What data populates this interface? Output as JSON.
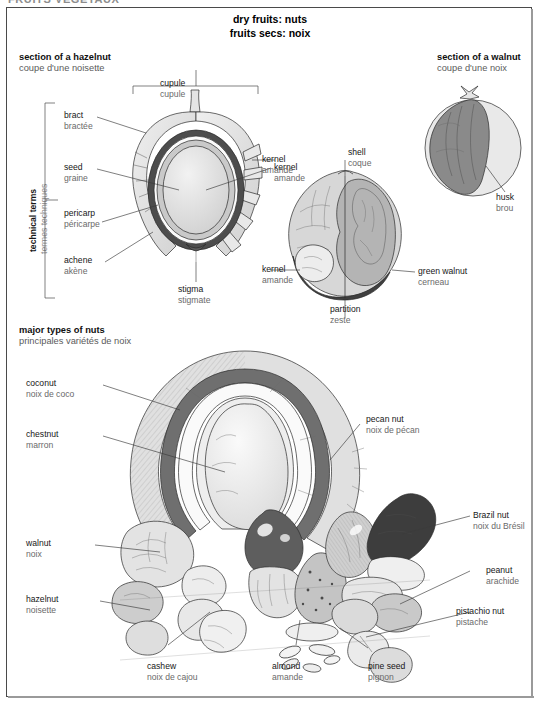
{
  "plate": {
    "cut_header": "FRUITS VEGETAUX",
    "title_en": "dry fruits: nuts",
    "title_fr": "fruits secs: noix"
  },
  "sections": {
    "hazelnut": {
      "en": "section of a hazelnut",
      "fr": "coupe d'une noisette"
    },
    "walnut": {
      "en": "section of a walnut",
      "fr": "coupe d'une noix"
    },
    "types": {
      "en": "major types of nuts",
      "fr": "principales variétés de noix"
    }
  },
  "bracket_label": {
    "en": "technical terms",
    "fr": "termes techniques"
  },
  "hazelnut_labels": [
    {
      "en": "cupule",
      "fr": "cupule"
    },
    {
      "en": "bract",
      "fr": "bractée"
    },
    {
      "en": "seed",
      "fr": "graine"
    },
    {
      "en": "pericarp",
      "fr": "péricarpe"
    },
    {
      "en": "achene",
      "fr": "akène"
    },
    {
      "en": "stigma",
      "fr": "stigmate"
    },
    {
      "en": "kernel",
      "fr": "amande"
    }
  ],
  "walnut_labels": [
    {
      "en": "husk",
      "fr": "brou"
    },
    {
      "en": "shell",
      "fr": "coque"
    },
    {
      "en": "kernel",
      "fr": "amande"
    },
    {
      "en": "green walnut",
      "fr": "cerneau"
    },
    {
      "en": "partition",
      "fr": "zeste"
    }
  ],
  "nut_types": [
    {
      "en": "coconut",
      "fr": "noix de coco"
    },
    {
      "en": "chestnut",
      "fr": "marron"
    },
    {
      "en": "walnut",
      "fr": "noix"
    },
    {
      "en": "hazelnut",
      "fr": "noisette"
    },
    {
      "en": "cashew",
      "fr": "noix de cajou"
    },
    {
      "en": "almond",
      "fr": "amande"
    },
    {
      "en": "pine seed",
      "fr": "pignon"
    },
    {
      "en": "pecan nut",
      "fr": "noix de pécan"
    },
    {
      "en": "Brazil nut",
      "fr": "noix du Brésil"
    },
    {
      "en": "peanut",
      "fr": "arachide"
    },
    {
      "en": "pistachio nut",
      "fr": "pistache"
    }
  ],
  "colors": {
    "frame": "#4a4a4a",
    "label_en": "#171717",
    "label_fr": "#6a6a6a",
    "shade_dark": "#4d4d4d",
    "shade_mid": "#9e9e9e",
    "shade_light": "#d8d8d8",
    "shade_pale": "#ececec"
  }
}
